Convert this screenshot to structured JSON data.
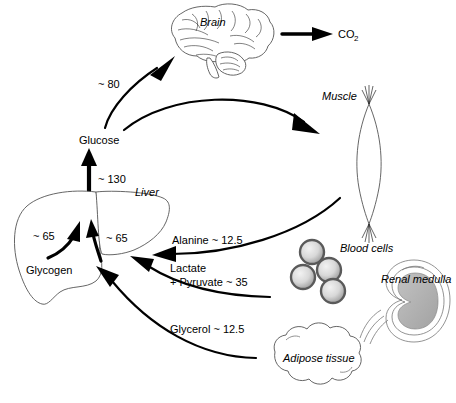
{
  "diagram": {
    "background_color": "#ffffff",
    "width": 456,
    "height": 403
  },
  "nodes": {
    "brain": {
      "label": "Brain",
      "style": "italic"
    },
    "co2": {
      "label": "CO",
      "subscript": "2"
    },
    "glucose": {
      "label": "Glucose"
    },
    "liver": {
      "label": "Liver",
      "style": "italic"
    },
    "glycogen": {
      "label": "Glycogen"
    },
    "muscle": {
      "label": "Muscle",
      "style": "italic"
    },
    "blood_cells": {
      "label": "Blood cells",
      "style": "italic"
    },
    "renal_medulla": {
      "label": "Renal medulla",
      "style": "italic"
    },
    "adipose": {
      "label": "Adipose tissue",
      "style": "italic"
    }
  },
  "flux_labels": {
    "glucose_to_brain": "~ 80",
    "liver_to_glucose": "~ 130",
    "glycogen_left": "~ 65",
    "glycogen_right": "~ 65",
    "alanine": "Alanine ~ 12.5",
    "lactate": "Lactate",
    "pyruvate": "+ Pyruvate ~ 35",
    "glycerol": "Glycerol ~ 12.5"
  },
  "colors": {
    "ink": "#000000",
    "outline": "#555555",
    "medulla_fill": "#b0b0b0",
    "cell_ring": "#5a5a5a",
    "cell_center": "#e8e8e8"
  }
}
